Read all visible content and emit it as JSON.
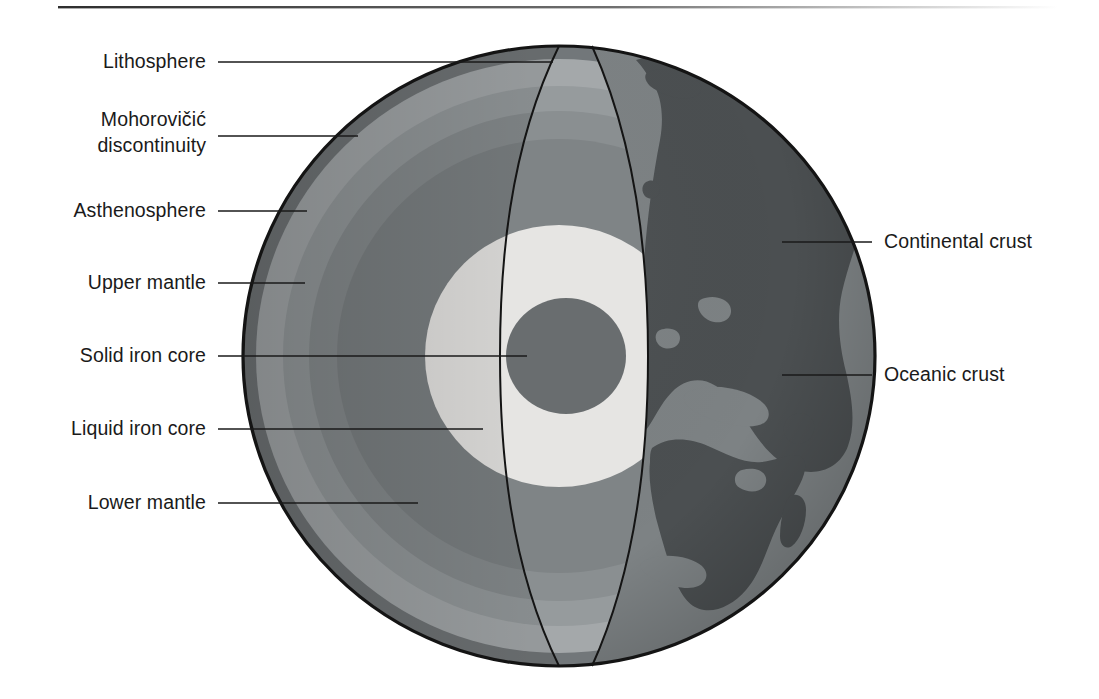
{
  "figure": {
    "background_color": "#ffffff",
    "top_rule_color": "#3a3a3a"
  },
  "labels": {
    "left": [
      {
        "id": "lithosphere",
        "text": "Lithosphere",
        "text_x": 206,
        "text_y": 68,
        "line_x1": 218,
        "line_y1": 62,
        "line_x2": 553,
        "line_y2": 62
      },
      {
        "id": "moho-line1",
        "text": "Mohorovičić",
        "text_x": 206,
        "text_y": 126
      },
      {
        "id": "moho-line2",
        "text": "discontinuity",
        "text_x": 206,
        "text_y": 152,
        "line_x1": 218,
        "line_y1": 136,
        "line_x2": 358,
        "line_y2": 136
      },
      {
        "id": "asthenosphere",
        "text": "Asthenosphere",
        "text_x": 206,
        "text_y": 217,
        "line_x1": 218,
        "line_y1": 211,
        "line_x2": 307,
        "line_y2": 211
      },
      {
        "id": "upper-mantle",
        "text": "Upper mantle",
        "text_x": 206,
        "text_y": 289,
        "line_x1": 218,
        "line_y1": 283,
        "line_x2": 305,
        "line_y2": 283
      },
      {
        "id": "solid-iron-core",
        "text": "Solid iron core",
        "text_x": 206,
        "text_y": 362,
        "line_x1": 218,
        "line_y1": 356,
        "line_x2": 527,
        "line_y2": 356
      },
      {
        "id": "liquid-iron-core",
        "text": "Liquid iron core",
        "text_x": 206,
        "text_y": 435,
        "line_x1": 218,
        "line_y1": 429,
        "line_x2": 483,
        "line_y2": 429
      },
      {
        "id": "lower-mantle",
        "text": "Lower mantle",
        "text_x": 206,
        "text_y": 509,
        "line_x1": 218,
        "line_y1": 503,
        "line_x2": 418,
        "line_y2": 503
      }
    ],
    "right": [
      {
        "id": "continental-crust",
        "text": "Continental crust",
        "text_x": 884,
        "text_y": 248,
        "line_x1": 782,
        "line_y1": 242,
        "line_x2": 872,
        "line_y2": 242
      },
      {
        "id": "oceanic-crust",
        "text": "Oceanic crust",
        "text_x": 884,
        "text_y": 381,
        "line_x1": 782,
        "line_y1": 375,
        "line_x2": 872,
        "line_y2": 375
      }
    ]
  },
  "geometry": {
    "globe_center_x": 559,
    "globe_center_y": 356,
    "globe_radius_x": 316,
    "globe_radius_y": 310,
    "cut_face_center_x": 559,
    "cut_ellipse_rx": 150
  },
  "layers": [
    {
      "id": "crust-rim",
      "name": "Crust rim",
      "color": "#666a6b"
    },
    {
      "id": "lithosphere",
      "name": "Lithosphere",
      "color": "#9a9ea0"
    },
    {
      "id": "asthenosphere",
      "name": "Asthenosphere",
      "color": "#8b9092"
    },
    {
      "id": "upper-mantle",
      "name": "Upper mantle",
      "color": "#7e8385"
    },
    {
      "id": "lower-mantle",
      "name": "Lower mantle",
      "color": "#74797b"
    },
    {
      "id": "liquid-iron-core",
      "name": "Liquid iron core",
      "color": "#dcdcda"
    },
    {
      "id": "solid-iron-core",
      "name": "Solid iron core",
      "color": "#5e6264"
    }
  ],
  "surface": {
    "oceanic_crust_color": "#7b8082",
    "continental_crust_color": "#4a4e50",
    "shadow_color": "#5f6466"
  }
}
